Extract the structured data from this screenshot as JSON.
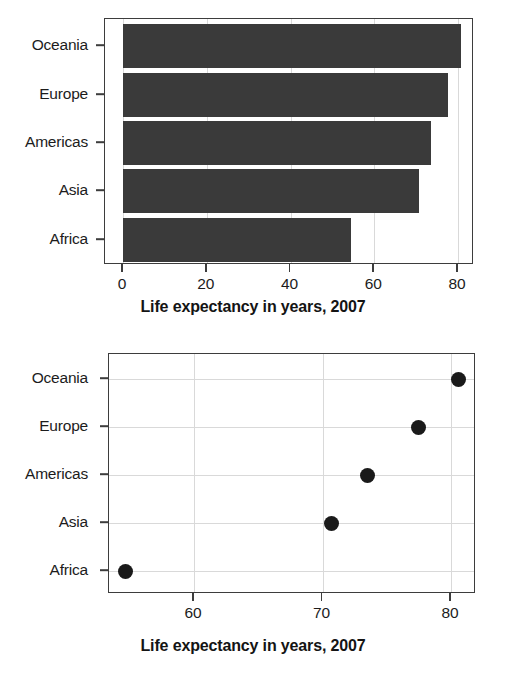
{
  "chart_data": [
    {
      "id": "bar",
      "type": "bar",
      "orientation": "horizontal",
      "title": "",
      "xlabel": "Life expectancy in years, 2007",
      "ylabel": "",
      "categories": [
        "Africa",
        "Asia",
        "Americas",
        "Europe",
        "Oceania"
      ],
      "values": [
        54.5,
        70.7,
        73.5,
        77.6,
        80.7
      ],
      "xlim": [
        0,
        84
      ],
      "ylim_categories_top_to_bottom": [
        "Oceania",
        "Europe",
        "Americas",
        "Asia",
        "Africa"
      ],
      "xticks": [
        0,
        20,
        40,
        60,
        80
      ],
      "xticklabels": [
        "0",
        "20",
        "40",
        "60",
        "80"
      ],
      "yticklabels": [
        "Oceania",
        "Europe",
        "Americas",
        "Asia",
        "Africa"
      ],
      "grid": "vertical",
      "legend": "none",
      "bar_color": "#3a3a3a",
      "frame_color": "#3d3d3d",
      "grid_color": "#d9d9d9"
    },
    {
      "id": "dot",
      "type": "scatter",
      "orientation": "horizontal",
      "title": "",
      "xlabel": "Life expectancy in years, 2007",
      "ylabel": "",
      "categories": [
        "Africa",
        "Asia",
        "Americas",
        "Europe",
        "Oceania"
      ],
      "values": [
        54.7,
        70.7,
        73.5,
        77.5,
        80.6
      ],
      "xlim": [
        53.2,
        82.2
      ],
      "ylim_categories_top_to_bottom": [
        "Oceania",
        "Europe",
        "Americas",
        "Asia",
        "Africa"
      ],
      "xticks": [
        60,
        70,
        80
      ],
      "xticklabels": [
        "60",
        "70",
        "80"
      ],
      "yticklabels": [
        "Oceania",
        "Europe",
        "Americas",
        "Asia",
        "Africa"
      ],
      "grid": "both",
      "legend": "none",
      "point_color": "#1a1a1a",
      "frame_color": "#3d3d3d",
      "grid_color": "#d9d9d9"
    }
  ]
}
